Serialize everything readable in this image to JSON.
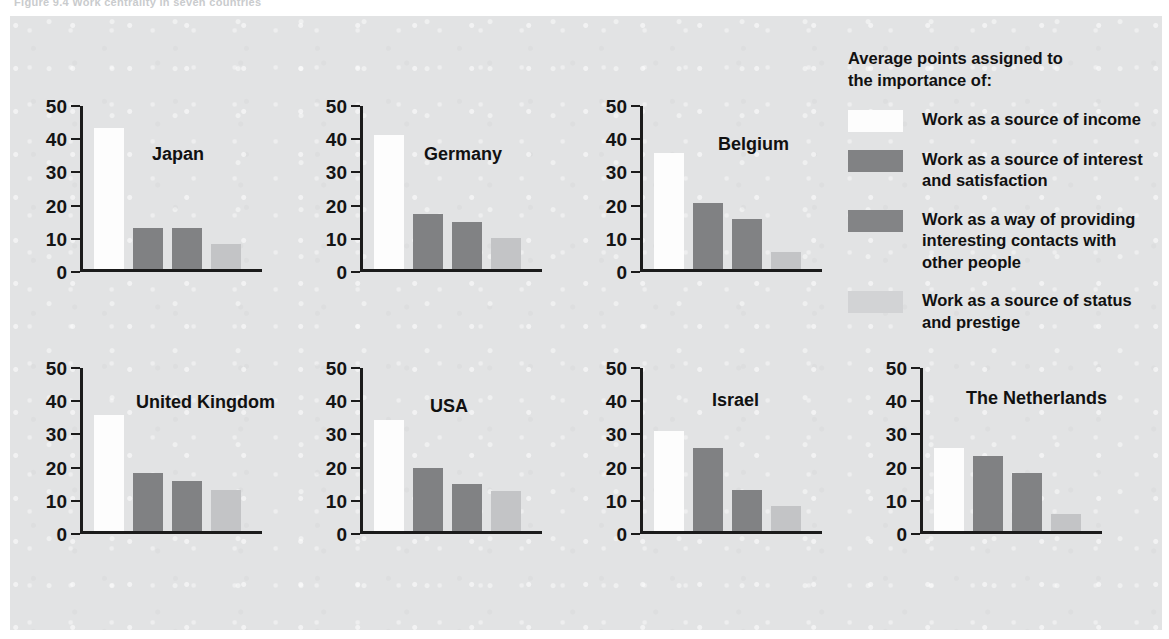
{
  "figure": {
    "caption": "Figure 9.4   Work centrality in seven countries"
  },
  "legend": {
    "title": "Average points assigned to\nthe importance of:",
    "items": [
      {
        "label": "Work as a source of income",
        "color": "#fdfdfd"
      },
      {
        "label": "Work as a source of interest\nand satisfaction",
        "color": "#818284"
      },
      {
        "label": "Work as a way of providing\ninteresting contacts with\nother people",
        "color": "#838486"
      },
      {
        "label": "Work as a source of status\nand prestige",
        "color": "#d2d3d5"
      }
    ]
  },
  "axis": {
    "ticks": [
      0,
      10,
      20,
      30,
      40,
      50
    ],
    "ymin": 0,
    "ymax": 50
  },
  "chart_data": {
    "type": "bar",
    "title": "Work centrality in seven countries",
    "xlabel": "",
    "ylabel": "Average points assigned",
    "ylim": [
      0,
      50
    ],
    "grid": false,
    "legend_position": "right",
    "categories": [
      "Work as a source of income",
      "Work as a source of interest and satisfaction",
      "Work as a way of providing interesting contacts with other people",
      "Work as a source of status and prestige"
    ],
    "panels": [
      {
        "name": "Japan",
        "values": [
          42.5,
          12.5,
          12.5,
          7.5
        ]
      },
      {
        "name": "Germany",
        "values": [
          40.3,
          16.5,
          14.3,
          9.3
        ]
      },
      {
        "name": "Belgium",
        "values": [
          35.0,
          20.0,
          15.0,
          5.0
        ]
      },
      {
        "name": "United Kingdom",
        "values": [
          35.0,
          17.5,
          15.0,
          12.5
        ]
      },
      {
        "name": "USA",
        "values": [
          33.5,
          19.0,
          14.3,
          12.0
        ]
      },
      {
        "name": "Israel",
        "values": [
          30.0,
          25.0,
          12.5,
          7.5
        ]
      },
      {
        "name": "The Netherlands",
        "values": [
          25.0,
          22.5,
          17.5,
          5.0
        ]
      }
    ]
  },
  "colors": {
    "plate_background": "#e2e3e4",
    "axis": "#1b1b1b",
    "text": "#111111",
    "series": [
      "#fdfdfd",
      "#808183",
      "#818284",
      "#c3c4c6"
    ]
  }
}
